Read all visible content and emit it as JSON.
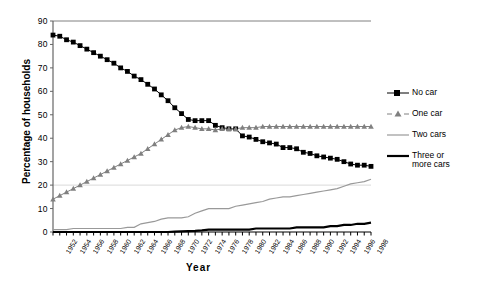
{
  "chart_data": {
    "type": "line",
    "title": "",
    "xlabel": "Year",
    "ylabel": "Percentage of households",
    "ylim": [
      0,
      90
    ],
    "ytick_values": [
      0,
      10,
      20,
      30,
      40,
      50,
      60,
      70,
      80,
      90
    ],
    "grid": "horizontal-faint-at-20",
    "legend_position": "right",
    "x": [
      1952,
      1953,
      1954,
      1955,
      1956,
      1957,
      1958,
      1959,
      1960,
      1961,
      1962,
      1963,
      1964,
      1965,
      1966,
      1967,
      1968,
      1969,
      1970,
      1971,
      1972,
      1973,
      1974,
      1975,
      1976,
      1977,
      1978,
      1979,
      1980,
      1981,
      1982,
      1983,
      1984,
      1985,
      1986,
      1987,
      1988,
      1989,
      1990,
      1991,
      1992,
      1993,
      1994,
      1995,
      1996,
      1997,
      1998,
      1999
    ],
    "xtick_labels": [
      "1952",
      "1954",
      "1956",
      "1958",
      "1960",
      "1962",
      "1964",
      "1966",
      "1968",
      "1970",
      "1972",
      "1974",
      "1976",
      "1978",
      "1980",
      "1982",
      "1984",
      "1986",
      "1988",
      "1990",
      "1992",
      "1994",
      "1996",
      "1998"
    ],
    "series": [
      {
        "name": "No car",
        "marker": "square",
        "color": "#000000",
        "values": [
          84,
          83.5,
          82,
          81,
          79.5,
          78,
          76.5,
          75,
          73.5,
          72,
          70,
          68.5,
          66.5,
          65,
          63,
          61,
          58.5,
          56,
          53,
          50.5,
          48,
          47.5,
          47.5,
          47.5,
          45.5,
          44.5,
          44,
          44,
          41,
          40.5,
          39.5,
          38.5,
          38,
          37.5,
          36,
          36,
          35.5,
          34,
          33.5,
          32.5,
          32,
          31.5,
          31,
          30,
          29,
          28.5,
          28.5,
          28
        ]
      },
      {
        "name": "One car",
        "marker": "triangle",
        "color": "#808080",
        "values": [
          14,
          15.5,
          17,
          18.5,
          20,
          21.5,
          23,
          24.5,
          26,
          27.5,
          29,
          30.5,
          32,
          33.5,
          35.5,
          37.5,
          39.5,
          41.5,
          43.5,
          44.5,
          45,
          44.5,
          44,
          44,
          43.5,
          44,
          44,
          44,
          44.5,
          44.5,
          44.5,
          45,
          45,
          45,
          45,
          45,
          45,
          45,
          45,
          45,
          45,
          45,
          45,
          45,
          45,
          45,
          45,
          45
        ]
      },
      {
        "name": "Two cars",
        "marker": "none",
        "color": "#999999",
        "values": [
          1,
          1,
          1,
          1.5,
          1.5,
          1.5,
          1.5,
          1.5,
          1.5,
          1.5,
          1.5,
          2,
          2,
          3.5,
          4,
          4.5,
          5.5,
          6,
          6,
          6,
          6.5,
          8,
          9,
          10,
          10,
          10,
          10,
          11,
          11.5,
          12,
          12.5,
          13,
          14,
          14.5,
          15,
          15,
          15.5,
          16,
          16.5,
          17,
          17.5,
          18,
          18.5,
          19.5,
          20.5,
          21,
          21.5,
          22.5
        ]
      },
      {
        "name": "Three or more cars",
        "marker": "none",
        "color": "#000000",
        "values": [
          0,
          0,
          0,
          0,
          0,
          0,
          0,
          0,
          0,
          0,
          0,
          0,
          0,
          0,
          0,
          0,
          0,
          0,
          0.2,
          0.3,
          0.4,
          0.5,
          0.7,
          1,
          1,
          1,
          1,
          1,
          1,
          1,
          1.5,
          1.5,
          1.5,
          1.5,
          1.5,
          1.5,
          2,
          2,
          2,
          2,
          2,
          2.5,
          2.5,
          3,
          3,
          3.5,
          3.5,
          4
        ]
      }
    ],
    "legend": [
      {
        "label_line1": "No car",
        "label_line2": ""
      },
      {
        "label_line1": "One car",
        "label_line2": ""
      },
      {
        "label_line1": "Two cars",
        "label_line2": ""
      },
      {
        "label_line1": "Three or",
        "label_line2": "more cars"
      }
    ]
  }
}
